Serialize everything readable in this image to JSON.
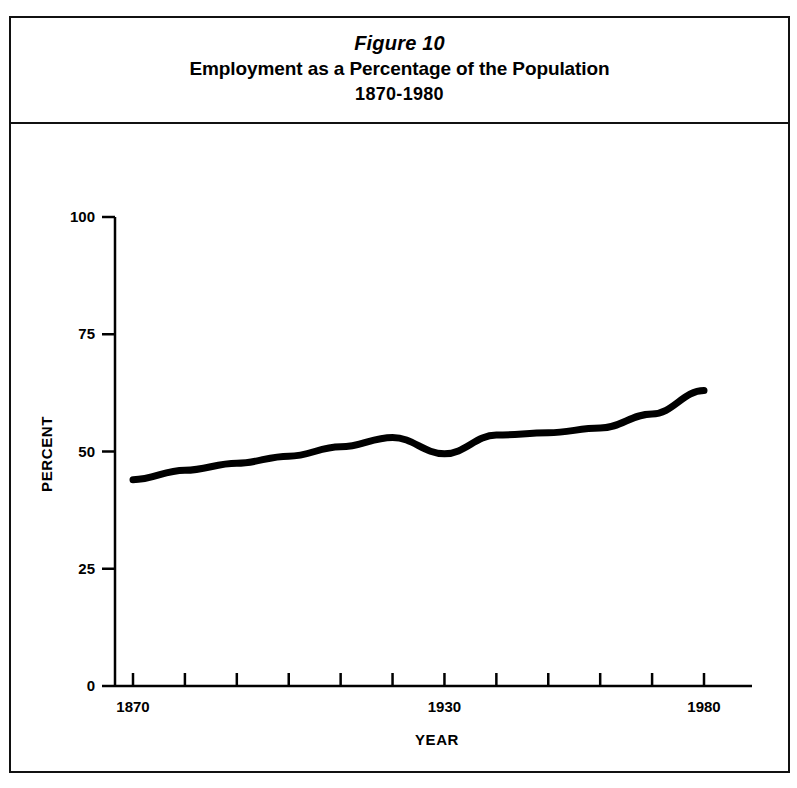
{
  "figure": {
    "number_label": "Figure 10",
    "title": "Employment as a Percentage of the Population",
    "subtitle": "1870-1980"
  },
  "chart_data": {
    "type": "line",
    "title": "Employment as a Percentage of the Population",
    "subtitle": "1870-1980",
    "xlabel": "YEAR",
    "ylabel": "PERCENT",
    "xlim": [
      1870,
      1990
    ],
    "ylim": [
      0,
      100
    ],
    "grid": false,
    "legend": null,
    "x_tick_labels": [
      "1870",
      "1930",
      "1980"
    ],
    "x_tick_label_values": [
      1870,
      1930,
      1980
    ],
    "x_ticks_all": [
      1870,
      1880,
      1890,
      1900,
      1910,
      1920,
      1930,
      1940,
      1950,
      1960,
      1970,
      1980
    ],
    "y_tick_labels": [
      "0",
      "25",
      "50",
      "75",
      "100"
    ],
    "y_tick_values": [
      0,
      25,
      50,
      75,
      100
    ],
    "x": [
      1870,
      1880,
      1890,
      1900,
      1910,
      1920,
      1930,
      1940,
      1950,
      1960,
      1970,
      1980
    ],
    "values": [
      44,
      46,
      47.5,
      49,
      51,
      53,
      49.5,
      53.5,
      54,
      55,
      58,
      63
    ],
    "series": [
      {
        "name": "Employment as a percentage of the population",
        "values": [
          44,
          46,
          47.5,
          49,
          51,
          53,
          49.5,
          53.5,
          54,
          55,
          58,
          63
        ]
      }
    ],
    "line_color": "#000000",
    "line_width": 7
  },
  "colors": {
    "frame": "#111111",
    "ink": "#000000",
    "background": "#ffffff"
  }
}
